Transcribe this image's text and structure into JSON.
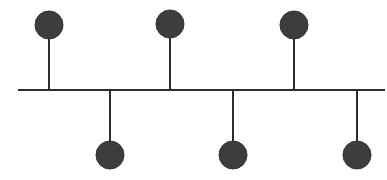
{
  "diagram": {
    "type": "bus-topology",
    "colors": {
      "background": "#ffffff",
      "line": "#2e2e2e",
      "node_fill": "#3d3d3d",
      "node_stroke": "#333333"
    },
    "bus": {
      "x1": 18,
      "x2": 385,
      "y": 90,
      "stroke_width": 2
    },
    "node_radius": 14,
    "nodes": [
      {
        "id": "top-1",
        "position": "top",
        "x": 49,
        "cy": 25
      },
      {
        "id": "bottom-1",
        "position": "bottom",
        "x": 110,
        "cy": 155
      },
      {
        "id": "top-2",
        "position": "top",
        "x": 170,
        "cy": 24
      },
      {
        "id": "bottom-2",
        "position": "bottom",
        "x": 233,
        "cy": 155
      },
      {
        "id": "top-3",
        "position": "top",
        "x": 294,
        "cy": 25
      },
      {
        "id": "bottom-3",
        "position": "bottom",
        "x": 357,
        "cy": 155
      }
    ]
  }
}
